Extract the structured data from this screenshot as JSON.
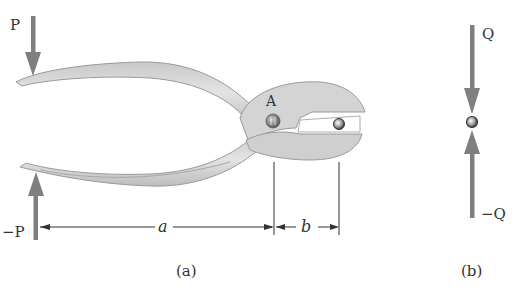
{
  "figure": {
    "panel_a": {
      "caption": "(a)",
      "force_top_label": "P",
      "force_bottom_label": "−P",
      "pivot_label": "A",
      "dimension_a_label": "a",
      "dimension_b_label": "b"
    },
    "panel_b": {
      "caption": "(b)",
      "force_top_label": "Q",
      "force_bottom_label": "−Q"
    }
  },
  "colors": {
    "arrow": "#7f7f7f",
    "pliers_fill": "#d6d6d6",
    "pliers_edge": "#9a9a9a",
    "text": "#333333",
    "dimension_line": "#333333"
  }
}
